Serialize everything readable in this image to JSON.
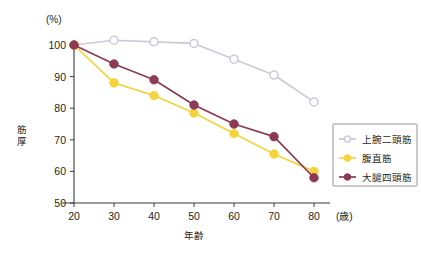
{
  "chart_data": {
    "type": "line",
    "title": "",
    "xlabel": "年齢",
    "ylabel": "筋厚",
    "x_unit": "(歳)",
    "y_unit": "(%)",
    "x": [
      20,
      30,
      40,
      50,
      60,
      70,
      80
    ],
    "xticks": [
      "20",
      "30",
      "40",
      "50",
      "60",
      "70",
      "80"
    ],
    "yticks": [
      "50",
      "60",
      "70",
      "80",
      "90",
      "100"
    ],
    "xlim": [
      15,
      85
    ],
    "ylim": [
      50,
      105
    ],
    "grid": false,
    "legend_position": "right-middle",
    "series": [
      {
        "name": "上腕二頭筋",
        "color": "#cfc8d6",
        "marker": "open-circle",
        "values": [
          100,
          101.5,
          101,
          100.5,
          95.5,
          90.5,
          82
        ]
      },
      {
        "name": "腹直筋",
        "color": "#f4d33c",
        "marker": "filled-circle",
        "values": [
          100,
          88,
          84,
          78.5,
          72,
          65.5,
          60
        ]
      },
      {
        "name": "大腿四頭筋",
        "color": "#8e3a55",
        "marker": "filled-circle",
        "values": [
          100,
          94,
          89,
          81,
          75,
          71,
          58
        ]
      }
    ]
  },
  "legend": {
    "items": [
      {
        "label": "上腕二頭筋",
        "color": "#cfc8d6",
        "marker": "open-circle"
      },
      {
        "label": "腹直筋",
        "color": "#f4d33c",
        "marker": "filled-circle"
      },
      {
        "label": "大腿四頭筋",
        "color": "#8e3a55",
        "marker": "filled-circle"
      }
    ]
  },
  "colors": {
    "biceps": "#cfc8d6",
    "abdominis": "#f4d33c",
    "quadriceps": "#8e3a55",
    "axis": "#3b3b3b",
    "background": "#ffffff"
  }
}
